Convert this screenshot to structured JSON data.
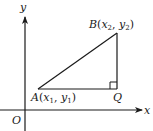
{
  "diagram": {
    "axes": {
      "x_label": "x",
      "y_label": "y",
      "origin_label": "O"
    },
    "points": {
      "A": {
        "name": "A",
        "x_sub": "1",
        "y_sub": "1",
        "x_var": "x",
        "y_var": "y"
      },
      "B": {
        "name": "B",
        "x_sub": "2",
        "y_sub": "2",
        "x_var": "x",
        "y_var": "y"
      },
      "Q": {
        "name": "Q"
      }
    },
    "right_angle_at": "Q",
    "colors": {
      "stroke": "#1a1a1a",
      "background": "#ffffff"
    }
  }
}
